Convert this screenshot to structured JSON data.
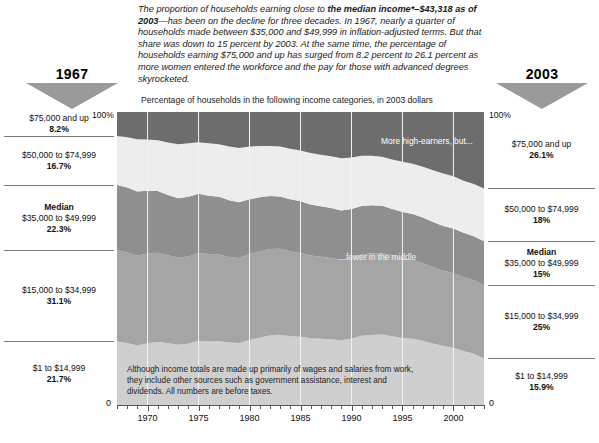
{
  "headline": {
    "part1": "The proportion of households earning close to ",
    "bold1": "the median income*–$43,318 as of 2003",
    "part2": "—has been on the decline for three decades. In 1967, nearly a quarter of households made between $35,000 and $49,999 in inflation-adjusted terms. But that share was down to 15 percent by 2003. At the same time, the percentage of households earning $75,000 and up has surged from 8.2 percent to 26.1 percent as more women entered the workforce and the pay for those with advanced degrees skyrocketed."
  },
  "year_left": "1967",
  "year_right": "2003",
  "subtitle": "Percentage of households in the following income categories, in 2003 dollars",
  "annotations": {
    "high_earners": "More high-earners, but...",
    "middle": "...fewer in the middle"
  },
  "footnote": "Although income totals are made up primarily of wages and salaries from work, they include other sources such as government assistance, interest and dividends. All numbers are before taxes.",
  "axis": {
    "top_label_left": "100%",
    "top_label_right": "100%",
    "zero_label_left": "0",
    "zero_label_right": "0",
    "tick_labels": [
      "1970",
      "1975",
      "1980",
      "1985",
      "1990",
      "1995",
      "2000"
    ],
    "tick_values": [
      1970,
      1975,
      1980,
      1985,
      1990,
      1995,
      2000
    ],
    "minor_step": 1
  },
  "legend_left": [
    {
      "range": "$75,000 and up",
      "value": "8.2%",
      "median": false
    },
    {
      "range": "$50,000 to $74,999",
      "value": "16.7%",
      "median": false
    },
    {
      "range": "$35,000 to $49,999",
      "value": "22.3%",
      "median": true,
      "median_label": "Median"
    },
    {
      "range": "$15,000 to $34,999",
      "value": "31.1%",
      "median": false
    },
    {
      "range": "$1 to $14,999",
      "value": "21.7%",
      "median": false
    }
  ],
  "legend_right": [
    {
      "range": "$75,000 and up",
      "value": "26.1%",
      "median": false
    },
    {
      "range": "$50,000 to $74,999",
      "value": "18%",
      "median": false
    },
    {
      "range": "$35,000 to $49,999",
      "value": "15%",
      "median": true,
      "median_label": "Median"
    },
    {
      "range": "$15,000 to $34,999",
      "value": "25%",
      "median": false
    },
    {
      "range": "$1 to $14,999",
      "value": "15.9%",
      "median": false
    }
  ],
  "colors": {
    "band_75k_up": "#6d6d6d",
    "band_50_75": "#ededed",
    "band_35_50": "#8f8f8f",
    "band_15_35": "#a5a5a5",
    "band_1_15": "#cfcfcf",
    "triangle": "#9a9a9a",
    "gridline": "#f2f2f2",
    "axis": "#555555"
  },
  "chart_data": {
    "type": "area",
    "title": "Percentage of households in the following income categories, in 2003 dollars",
    "xlabel": "",
    "ylabel": "Percentage of households",
    "xlim": [
      1967,
      2003
    ],
    "ylim": [
      0,
      100
    ],
    "grid": true,
    "stacked": true,
    "stack_order_top_to_bottom": [
      "$75,000 and up",
      "$50,000 to $74,999",
      "$35,000 to $49,999",
      "$15,000 to $34,999",
      "$1 to $14,999"
    ],
    "legend_position": "outside-left-and-right",
    "x": [
      1967,
      1968,
      1969,
      1970,
      1971,
      1972,
      1973,
      1974,
      1975,
      1976,
      1977,
      1978,
      1979,
      1980,
      1981,
      1982,
      1983,
      1984,
      1985,
      1986,
      1987,
      1988,
      1989,
      1990,
      1991,
      1992,
      1993,
      1994,
      1995,
      1996,
      1997,
      1998,
      1999,
      2000,
      2001,
      2002,
      2003
    ],
    "series": [
      {
        "name": "$75,000 and up",
        "color": "#6d6d6d",
        "values": [
          8.2,
          8.6,
          9.3,
          9.4,
          9.6,
          10.4,
          11.0,
          10.7,
          10.3,
          10.7,
          11.0,
          11.8,
          12.3,
          11.8,
          11.6,
          11.6,
          11.8,
          12.5,
          13.1,
          14.0,
          14.6,
          15.1,
          15.8,
          15.5,
          14.9,
          14.9,
          15.3,
          16.2,
          17.0,
          17.7,
          18.7,
          19.9,
          21.0,
          21.9,
          23.5,
          24.6,
          26.1
        ]
      },
      {
        "name": "$50,000 to $74,999",
        "color": "#ededed",
        "values": [
          16.7,
          17.2,
          17.8,
          17.5,
          17.4,
          17.9,
          18.4,
          18.2,
          17.6,
          17.9,
          17.9,
          18.3,
          18.5,
          18.0,
          17.5,
          17.1,
          17.0,
          17.3,
          17.4,
          17.6,
          17.6,
          17.7,
          17.8,
          17.6,
          17.2,
          16.9,
          16.7,
          16.9,
          17.1,
          17.1,
          17.3,
          17.6,
          17.9,
          17.9,
          17.7,
          17.8,
          18.0
        ]
      },
      {
        "name": "$35,000 to $49,999",
        "color": "#8f8f8f",
        "values": [
          22.3,
          22.1,
          22.0,
          21.4,
          21.0,
          20.6,
          20.3,
          20.4,
          20.2,
          19.9,
          19.7,
          19.4,
          19.0,
          18.7,
          18.5,
          18.1,
          17.9,
          17.8,
          17.6,
          17.4,
          17.2,
          17.0,
          16.8,
          16.6,
          16.5,
          16.4,
          16.1,
          15.9,
          15.8,
          15.7,
          15.6,
          15.4,
          15.3,
          15.2,
          15.1,
          15.0,
          15.0
        ]
      },
      {
        "name": "$15,000 to $34,999",
        "color": "#a5a5a5",
        "values": [
          31.1,
          30.9,
          30.6,
          30.6,
          30.5,
          30.0,
          29.7,
          29.8,
          30.0,
          29.8,
          29.6,
          29.2,
          29.0,
          29.3,
          29.4,
          29.5,
          29.3,
          28.9,
          28.6,
          28.2,
          28.0,
          27.8,
          27.5,
          27.6,
          27.8,
          27.9,
          27.8,
          27.5,
          27.2,
          26.9,
          26.5,
          26.1,
          25.7,
          25.5,
          25.3,
          25.1,
          25.0
        ]
      },
      {
        "name": "$1 to $14,999",
        "color": "#cfcfcf",
        "values": [
          21.7,
          21.2,
          20.3,
          21.1,
          21.5,
          21.1,
          20.6,
          20.9,
          21.9,
          21.7,
          21.8,
          21.3,
          21.2,
          22.2,
          23.0,
          23.7,
          24.0,
          23.5,
          23.3,
          22.8,
          22.6,
          22.4,
          22.1,
          22.7,
          23.6,
          23.9,
          24.1,
          23.5,
          22.9,
          22.6,
          21.9,
          21.0,
          20.1,
          19.5,
          18.4,
          17.5,
          15.9
        ]
      }
    ]
  }
}
